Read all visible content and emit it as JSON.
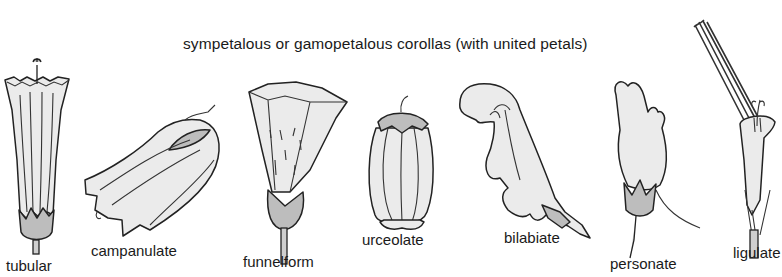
{
  "title": "sympetalous or gamopetalous corollas (with united petals)",
  "corolla_types": [
    {
      "name": "tubular",
      "label": "tubular"
    },
    {
      "name": "campanulate",
      "label": "campanulate"
    },
    {
      "name": "funnelform",
      "label": "funnelform"
    },
    {
      "name": "urceolate",
      "label": "urceolate"
    },
    {
      "name": "bilabiate",
      "label": "bilabiate"
    },
    {
      "name": "personate",
      "label": "personate"
    },
    {
      "name": "ligulate",
      "label": "ligulate"
    }
  ]
}
